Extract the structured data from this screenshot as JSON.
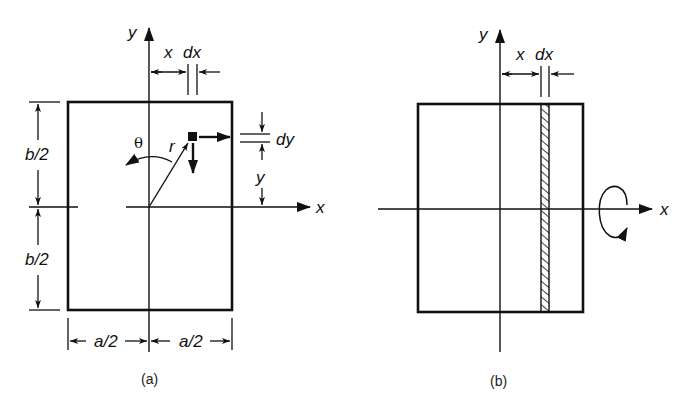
{
  "figure": {
    "panel_a": {
      "caption": "(a)",
      "axis_labels": {
        "x": "x",
        "y": "y"
      },
      "dimension_labels": {
        "top_x": "x",
        "top_dx": "dx",
        "left_upper": "b/2",
        "left_lower": "b/2",
        "bottom_left": "a/2",
        "bottom_right": "a/2",
        "right_dy": "dy",
        "right_y": "y"
      },
      "element_labels": {
        "radius": "r",
        "angle": "θ"
      }
    },
    "panel_b": {
      "caption": "(b)",
      "axis_labels": {
        "x": "x",
        "y": "y"
      },
      "dimension_labels": {
        "top_x": "x",
        "top_dx": "dx"
      },
      "hatched_strip": "strip of width dx at distance x",
      "rotation_symbol": "moment about x-axis"
    },
    "colors": {
      "ink": "#111111",
      "background": "#ffffff"
    }
  }
}
